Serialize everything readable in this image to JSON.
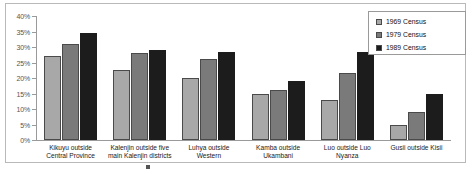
{
  "chart_data": {
    "type": "bar",
    "title": "",
    "xlabel": "",
    "ylabel": "",
    "ylim": [
      0,
      40
    ],
    "ytick_labels": [
      "40%",
      "35%",
      "30%",
      "25%",
      "20%",
      "15%",
      "10%",
      "5%",
      "0%"
    ],
    "ytick_values": [
      40,
      35,
      30,
      25,
      20,
      15,
      10,
      5,
      0
    ],
    "grid": false,
    "legend_position": "top-right",
    "categories": [
      "Kikuyu outside Central Province",
      "Kalenjin outside five main Kalenjin districts",
      "Luhya outside Western",
      "Kamba outside Ukambani",
      "Luo outside Luo Nyanza",
      "Gusii outside Kisii"
    ],
    "series": [
      {
        "name": "1969 Census",
        "color": "#a8a8a8",
        "values": [
          27,
          22.5,
          20,
          15,
          13,
          5
        ]
      },
      {
        "name": "1979 Census",
        "color": "#7a7a7a",
        "values": [
          31,
          28,
          26,
          16,
          21.5,
          9
        ]
      },
      {
        "name": "1989 Census",
        "color": "#1c1c1c",
        "values": [
          34.5,
          29,
          28.5,
          19,
          28.5,
          15
        ]
      }
    ]
  },
  "legend": {
    "entries": [
      {
        "label": "1969 Census"
      },
      {
        "label": "1979 Census"
      },
      {
        "label": "1989 Census"
      }
    ]
  },
  "caption": {
    "text": ""
  }
}
